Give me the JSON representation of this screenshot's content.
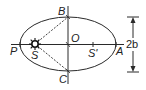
{
  "diagram": {
    "type": "elliptical-orbit",
    "stroke_color": "#2a2a2a",
    "background": "#ffffff",
    "ellipse": {
      "cx": 68,
      "cy": 44,
      "rx": 48,
      "ry": 27
    },
    "points": {
      "P": {
        "label": "P",
        "x": 20,
        "y": 44
      },
      "A": {
        "label": "A",
        "x": 116,
        "y": 44
      },
      "B": {
        "label": "B",
        "x": 68,
        "y": 17
      },
      "C": {
        "label": "C",
        "x": 68,
        "y": 71
      },
      "O": {
        "label": "O",
        "x": 68,
        "y": 44
      },
      "S": {
        "label": "S",
        "x": 35,
        "y": 44
      },
      "S_prime": {
        "label": "S'",
        "x": 93,
        "y": 44
      }
    },
    "dimension": {
      "label": "2b"
    },
    "sun_icon": "sun-icon"
  }
}
